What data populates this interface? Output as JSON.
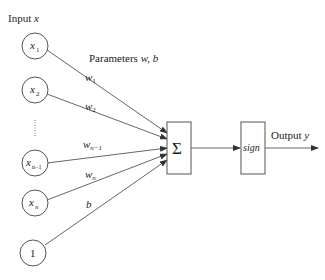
{
  "diagram": {
    "input_label": "Input x",
    "input_label_main": "Input ",
    "input_label_var": "x",
    "params_label_main": "Parameters ",
    "params_label_vars": "w, b",
    "inputs": [
      {
        "id": "x1",
        "base": "x",
        "sub": "1"
      },
      {
        "id": "x2",
        "base": "x",
        "sub": "2"
      },
      {
        "id": "xn-1",
        "base": "x",
        "sub": "n−1"
      },
      {
        "id": "xn",
        "base": "x",
        "sub": "n"
      },
      {
        "id": "bias",
        "base": "1",
        "sub": ""
      }
    ],
    "ellipsis": "⋮",
    "weights": [
      {
        "base": "w",
        "sub": "1"
      },
      {
        "base": "w",
        "sub": "2"
      },
      {
        "base": "w",
        "sub": "n−1"
      },
      {
        "base": "w",
        "sub": "n"
      },
      {
        "base": "b",
        "sub": ""
      }
    ],
    "sum_node": "Σ",
    "activation_node": "sign",
    "output_label_main": "Output ",
    "output_label_var": "y"
  }
}
